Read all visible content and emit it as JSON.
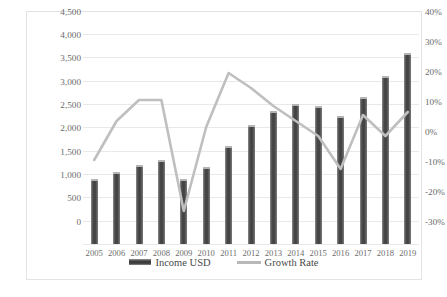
{
  "chart_data": {
    "type": "bar",
    "title": "",
    "subtitle": "",
    "xlabel": "",
    "ylabel": "",
    "grid": true,
    "legend_position": "bottom",
    "categories": [
      "2005",
      "2006",
      "2007",
      "2008",
      "2009",
      "2010",
      "2011",
      "2012",
      "2013",
      "2014",
      "2015",
      "2016",
      "2017",
      "2018",
      "2019"
    ],
    "series": [
      {
        "name": "Income USD",
        "type": "bar",
        "axis": "left",
        "color": "#404040",
        "values": [
          1400,
          1550,
          1700,
          1800,
          1400,
          1650,
          2100,
          2550,
          2850,
          3000,
          2950,
          2750,
          3150,
          3600,
          4100
        ]
      },
      {
        "name": "Growth Rate",
        "type": "line",
        "axis": "right",
        "color": "#bfbfbf",
        "values": [
          -2,
          11,
          18,
          18,
          -19,
          9,
          27,
          22,
          16,
          11,
          6,
          -5,
          13,
          6,
          14
        ]
      }
    ],
    "left_axis": {
      "label": "",
      "ylim": [
        0,
        4500
      ],
      "tick_step": 500,
      "ticks": [
        "0",
        "500",
        "1,000",
        "1,500",
        "2,000",
        "2,500",
        "3,000",
        "3,500",
        "4,000",
        "4,500"
      ],
      "tick_values": [
        0,
        500,
        1000,
        1500,
        2000,
        2500,
        3000,
        3500,
        4000,
        4500
      ]
    },
    "right_axis": {
      "label": "",
      "ylim": [
        -30,
        40
      ],
      "tick_step": 10,
      "ticks": [
        "-30%",
        "-20%",
        "-10%",
        "0%",
        "10%",
        "20%",
        "30%",
        "40%"
      ],
      "tick_values": [
        -30,
        -20,
        -10,
        0,
        10,
        20,
        30,
        40
      ]
    },
    "legend": [
      {
        "label": "Income USD",
        "marker": "bar",
        "color": "#404040"
      },
      {
        "label": "Growth Rate",
        "marker": "line",
        "color": "#bfbfbf"
      }
    ]
  },
  "colors": {
    "bar": "#404040",
    "line": "#bfbfbf",
    "grid": "#e9e9e9",
    "border": "#e3e3e3",
    "text": "#6b6b6b",
    "background": "#ffffff"
  }
}
